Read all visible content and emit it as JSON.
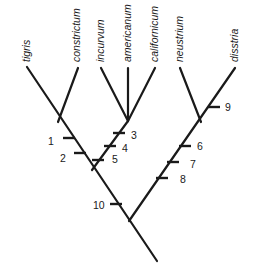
{
  "diagram": {
    "type": "cladogram",
    "taxa": [
      {
        "name": "tigris",
        "tip": [
          27,
          67
        ],
        "label_pos": [
          30,
          62
        ]
      },
      {
        "name": "constrictum",
        "tip": [
          78,
          68
        ],
        "label_pos": [
          80,
          62
        ]
      },
      {
        "name": "incurvum",
        "tip": [
          101,
          68
        ],
        "label_pos": [
          104,
          62
        ]
      },
      {
        "name": "americanum",
        "tip": [
          128,
          68
        ],
        "label_pos": [
          131,
          62
        ]
      },
      {
        "name": "californicum",
        "tip": [
          155,
          68
        ],
        "label_pos": [
          158,
          62
        ]
      },
      {
        "name": "neustrium",
        "tip": [
          180,
          68
        ],
        "label_pos": [
          183,
          62
        ]
      },
      {
        "name": "disstria",
        "tip": [
          235,
          68
        ],
        "label_pos": [
          238,
          62
        ]
      }
    ],
    "branches": [
      {
        "id": "tigris-to-root",
        "from": [
          27,
          67
        ],
        "to": [
          157,
          261
        ]
      },
      {
        "id": "constrictum",
        "from": [
          78,
          68
        ],
        "to": [
          58,
          122
        ]
      },
      {
        "id": "incurvum",
        "from": [
          101,
          68
        ],
        "to": [
          128,
          121
        ]
      },
      {
        "id": "americanum",
        "from": [
          128,
          68
        ],
        "to": [
          128,
          121
        ]
      },
      {
        "id": "californicum",
        "from": [
          155,
          68
        ],
        "to": [
          128,
          121
        ]
      },
      {
        "id": "clade-ica-stem",
        "from": [
          128,
          121
        ],
        "to": [
          92,
          170
        ]
      },
      {
        "id": "neustrium",
        "from": [
          180,
          68
        ],
        "to": [
          201,
          122
        ]
      },
      {
        "id": "disstria-to-join",
        "from": [
          235,
          68
        ],
        "to": [
          129,
          221
        ]
      }
    ],
    "characters": [
      {
        "label": "1",
        "tick": [
          69,
          138
        ],
        "label_pos": [
          48,
          145
        ]
      },
      {
        "label": "2",
        "tick": [
          80,
          153
        ],
        "label_pos": [
          60,
          162
        ]
      },
      {
        "label": "3",
        "tick": [
          119,
          133
        ],
        "label_pos": [
          131,
          139
        ]
      },
      {
        "label": "4",
        "tick": [
          110,
          146
        ],
        "label_pos": [
          122,
          152
        ]
      },
      {
        "label": "5",
        "tick": [
          98,
          160
        ],
        "label_pos": [
          112,
          163
        ]
      },
      {
        "label": "6",
        "tick": [
          185,
          146
        ],
        "label_pos": [
          197,
          150
        ]
      },
      {
        "label": "7",
        "tick": [
          173,
          162
        ],
        "label_pos": [
          190,
          168
        ]
      },
      {
        "label": "8",
        "tick": [
          162,
          178
        ],
        "label_pos": [
          180,
          183
        ]
      },
      {
        "label": "9",
        "tick": [
          214,
          107
        ],
        "label_pos": [
          225,
          111
        ]
      },
      {
        "label": "10",
        "tick": [
          116,
          204
        ],
        "label_pos": [
          93,
          209
        ]
      }
    ]
  }
}
